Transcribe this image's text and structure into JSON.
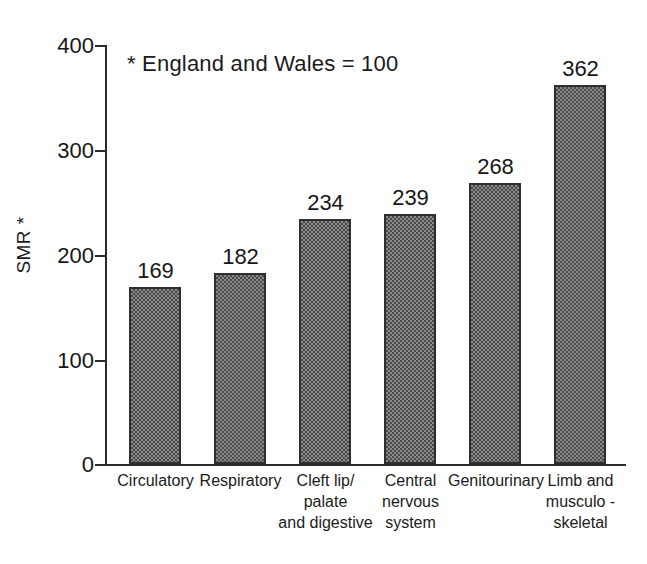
{
  "chart_data": {
    "type": "bar",
    "title": "",
    "subtitle": "",
    "xlabel": "",
    "ylabel": "SMR *",
    "ylim": [
      0,
      400
    ],
    "yticks": [
      0,
      100,
      200,
      300,
      400
    ],
    "ytick_labels": [
      "0",
      "100",
      "200",
      "300",
      "400"
    ],
    "grid": false,
    "legend": null,
    "annotations": [
      {
        "name": "footnote-note",
        "text": "* England and Wales = 100",
        "position": "inside-top-left"
      }
    ],
    "categories": [
      "Circulatory",
      "Respiratory",
      "Cleft lip/ palate and digestive",
      "Central nervous system",
      "Genitourinary",
      "Limb and musculo - skeletal"
    ],
    "category_label_lines": [
      [
        "Circulatory"
      ],
      [
        "Respiratory"
      ],
      [
        "Cleft lip/",
        "palate",
        "and digestive"
      ],
      [
        "Central",
        "nervous",
        "system"
      ],
      [
        "Genitourinary"
      ],
      [
        "Limb and",
        "musculo -",
        "skeletal"
      ]
    ],
    "values": [
      169,
      182,
      234,
      239,
      268,
      362
    ],
    "value_labels": [
      "169",
      "182",
      "234",
      "239",
      "268",
      "362"
    ],
    "bar_fill": "#8a8a8a",
    "bar_edge": "#2f2f2f",
    "axis_color": "#2b2b2b",
    "text_color": "#1b1b1b",
    "background": "#ffffff"
  }
}
